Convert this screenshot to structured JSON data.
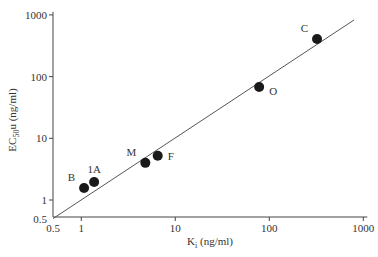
{
  "chart_data": {
    "type": "scatter",
    "title": "",
    "xlabel": "Ki (ng/ml)",
    "xlabel_main": "K",
    "xlabel_sub": "i",
    "xlabel_unit": " (ng/ml)",
    "ylabel": "EC50u (ng/ml)",
    "ylabel_main": "EC",
    "ylabel_sub": "50",
    "ylabel_unit": "u (ng/ml)",
    "xscale": "log",
    "yscale": "log",
    "xlim": [
      0.5,
      1000
    ],
    "ylim": [
      0.5,
      1000
    ],
    "x_ticks": [
      {
        "value": 0.5,
        "label": "0.5"
      },
      {
        "value": 1,
        "label": "1"
      },
      {
        "value": 10,
        "label": "10"
      },
      {
        "value": 100,
        "label": "100"
      },
      {
        "value": 1000,
        "label": "1000"
      }
    ],
    "y_ticks": [
      {
        "value": 0.5,
        "label": "0.5"
      },
      {
        "value": 1,
        "label": "1"
      },
      {
        "value": 10,
        "label": "10"
      },
      {
        "value": 100,
        "label": "100"
      },
      {
        "value": 1000,
        "label": "1000"
      }
    ],
    "grid": false,
    "points": [
      {
        "label": "B",
        "x": 1.07,
        "y": 1.56,
        "label_pos": "upper-left"
      },
      {
        "label": "1A",
        "x": 1.37,
        "y": 1.96,
        "label_pos": "above"
      },
      {
        "label": "M",
        "x": 4.8,
        "y": 4.0,
        "label_pos": "upper-left"
      },
      {
        "label": "F",
        "x": 6.5,
        "y": 5.2,
        "label_pos": "right"
      },
      {
        "label": "O",
        "x": 78,
        "y": 68,
        "label_pos": "lower-right"
      },
      {
        "label": "C",
        "x": 322,
        "y": 407,
        "label_pos": "upper-left"
      }
    ],
    "fit_line": {
      "x": [
        0.5,
        800
      ],
      "y": [
        0.5,
        830
      ]
    },
    "marker_color": "#1a1a1a",
    "line_color": "#555555"
  }
}
